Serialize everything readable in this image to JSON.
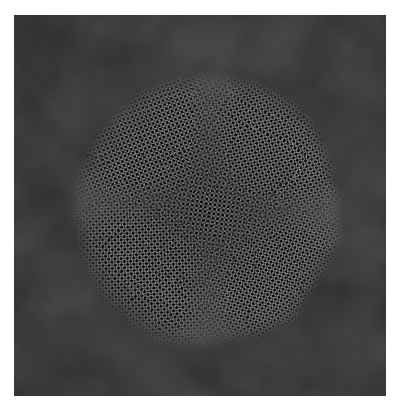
{
  "image": {
    "kind": "hrtem-micrograph",
    "description": "High-resolution transmission electron microscopy image of a crystalline nanoparticle on an amorphous carbon support film",
    "canvas": {
      "width": 399,
      "height": 408,
      "background_color": "#ffffff"
    },
    "frame": {
      "name": "micrograph-frame",
      "x": 14,
      "y": 15,
      "width": 372,
      "height": 381,
      "has_border": false,
      "border_color": "#ffffff"
    },
    "support_film": {
      "label": "amorphous carbon support film",
      "base_color": "#b8b8b8",
      "light_color": "#e8e8e8",
      "dark_color": "#4a4a4a",
      "mean_gray": 178,
      "texture": "fine isotropic speckle",
      "grain_size_px": 1.6
    },
    "particle": {
      "label": "crystalline nanoparticle",
      "shape": "faceted quasi-circular (multiply twinned)",
      "center_x": 207,
      "center_y": 211,
      "radius_x": 139,
      "radius_y": 141,
      "mean_gray": 96,
      "dark_color": "#1c1c1c",
      "light_color": "#cfcfcf",
      "edge_softness_px": 14,
      "bounding_box": {
        "left": 70,
        "top": 70,
        "right": 346,
        "bottom": 352
      }
    },
    "lattice": {
      "label": "atomic lattice fringes",
      "fringe_period_px": 4.4,
      "contrast": "high",
      "domains": [
        {
          "name": "domain-top-left",
          "angle_deg": -22,
          "period_px": 4.4,
          "center_x": 135,
          "center_y": 130,
          "radius": 95
        },
        {
          "name": "domain-top-right",
          "angle_deg": 34,
          "period_px": 4.3,
          "center_x": 288,
          "center_y": 135,
          "radius": 95
        },
        {
          "name": "domain-center",
          "angle_deg": 8,
          "period_px": 4.5,
          "center_x": 210,
          "center_y": 205,
          "radius": 90
        },
        {
          "name": "domain-bottom-left",
          "angle_deg": -48,
          "period_px": 4.4,
          "center_x": 130,
          "center_y": 282,
          "radius": 95
        },
        {
          "name": "domain-bottom-right",
          "angle_deg": 58,
          "period_px": 4.2,
          "center_x": 290,
          "center_y": 290,
          "radius": 95
        }
      ]
    },
    "annotations": {
      "scale_bar": null,
      "caption": null,
      "labels": []
    }
  }
}
